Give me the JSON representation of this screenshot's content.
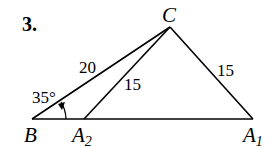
{
  "problem_number": "3.",
  "points": {
    "B": {
      "label": "B",
      "x": 32,
      "y": 119
    },
    "A2": {
      "label": "A",
      "sub": "2",
      "x": 84,
      "y": 119
    },
    "A1": {
      "label": "A",
      "sub": "1",
      "x": 253,
      "y": 119
    },
    "C": {
      "label": "C",
      "x": 170,
      "y": 27
    }
  },
  "measurements": {
    "BC": "20",
    "CA2": "15",
    "CA1": "15",
    "angle_B": "35°"
  },
  "colors": {
    "stroke": "#000000",
    "background": "#ffffff"
  }
}
